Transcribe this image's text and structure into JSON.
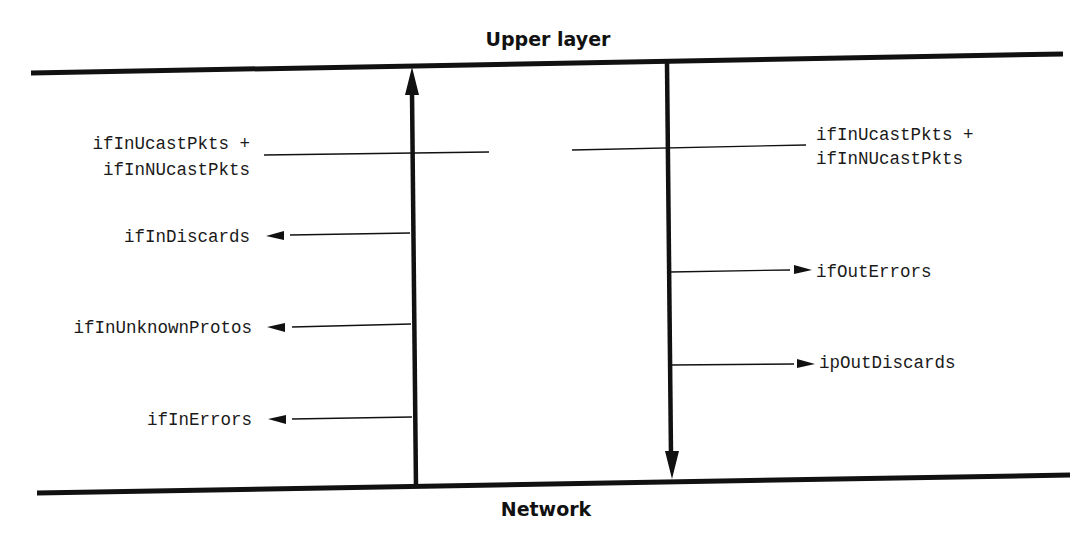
{
  "diagram": {
    "title_top": "Upper layer",
    "title_bottom": "Network",
    "colors": {
      "line": "#111111",
      "text": "#1a1a1a",
      "background": "#ffffff"
    },
    "incoming_path": {
      "direction": "up",
      "counters": {
        "delivered_line1": "ifInUcastPkts +",
        "delivered_line2": "ifInNUcastPkts",
        "discards": "ifInDiscards",
        "unknown_protos": "ifInUnknownProtos",
        "errors": "ifInErrors"
      }
    },
    "outgoing_path": {
      "direction": "down",
      "counters": {
        "requested_line1": "ifInUcastPkts +",
        "requested_line2": "ifInNUcastPkts",
        "errors": "ifOutErrors",
        "discards": "ipOutDiscards"
      }
    }
  }
}
